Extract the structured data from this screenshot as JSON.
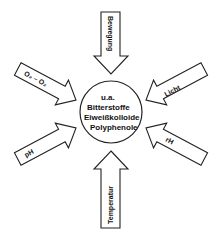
{
  "diagram": {
    "center": {
      "lines": [
        "u.a.",
        "Bitterstoffe",
        "Eiweißkolloide",
        "Polyphenole"
      ]
    },
    "arrows": [
      {
        "id": "top",
        "label": "Bewegung",
        "direction": "down"
      },
      {
        "id": "upper-left",
        "label": "O₂ – O₂",
        "direction": "down-right"
      },
      {
        "id": "upper-right",
        "label": "Licht",
        "direction": "down-left"
      },
      {
        "id": "lower-left",
        "label": "pH",
        "direction": "up-right"
      },
      {
        "id": "lower-right",
        "label": "rH",
        "direction": "up-left"
      },
      {
        "id": "bottom",
        "label": "Temperatur",
        "direction": "up"
      }
    ],
    "colors": {
      "stroke": "#222222",
      "fill": "#ffffff",
      "text": "#111111"
    }
  }
}
